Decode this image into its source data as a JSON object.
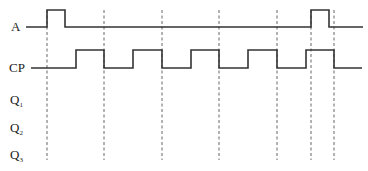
{
  "diagram": {
    "type": "timing-diagram",
    "signals": [
      {
        "name": "A",
        "label": "A",
        "subscript": "",
        "label_x": 11,
        "label_y": 31,
        "baseline_y": 27,
        "high_y": 10,
        "start_x": 26,
        "end_x": 363,
        "pulses": [
          [
            47,
            65
          ],
          [
            311,
            329
          ]
        ]
      },
      {
        "name": "CP",
        "label": "CP",
        "subscript": "",
        "label_x": 9,
        "label_y": 72,
        "baseline_y": 68,
        "high_y": 50,
        "start_x": 31,
        "end_x": 362,
        "pulses": [
          [
            76,
            104
          ],
          [
            133,
            162
          ],
          [
            191,
            219
          ],
          [
            248,
            277
          ],
          [
            306,
            334
          ]
        ]
      },
      {
        "name": "Q1",
        "label": "Q",
        "subscript": "1",
        "label_x": 10,
        "label_y": 104
      },
      {
        "name": "Q2",
        "label": "Q",
        "subscript": "2",
        "label_x": 10,
        "label_y": 132
      },
      {
        "name": "Q3",
        "label": "Q",
        "subscript": "3",
        "label_x": 10,
        "label_y": 159
      }
    ],
    "dashed_lines_x": [
      47,
      104,
      162,
      219,
      277,
      311,
      334
    ],
    "dashed_top_y": 10,
    "dashed_bottom_y": 160,
    "colors": {
      "signal": "#333333",
      "dashed": "#666666",
      "background": "#ffffff"
    }
  }
}
